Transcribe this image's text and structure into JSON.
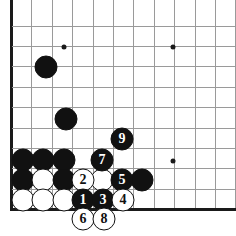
{
  "diagram": {
    "board": {
      "background_color": "#ffffff",
      "line_color": "#9a9a9a",
      "edge_color": "#1a1a1a",
      "grid_spacing": 20.4,
      "origin_x": 11.5,
      "origin_y": 26.0,
      "columns": 11,
      "rows": 10,
      "left_edge_is_board_border": true,
      "bottom_edge_is_board_border": true
    },
    "star_points": [
      {
        "name": "star-point-upper-left",
        "x": 64,
        "y": 47
      },
      {
        "name": "star-point-upper-right",
        "x": 173,
        "y": 47
      },
      {
        "name": "star-point-lower-right",
        "x": 173,
        "y": 161
      }
    ],
    "stones": [
      {
        "name": "black-stone-upper-left",
        "color": "black",
        "label": "",
        "x": 46,
        "y": 67
      },
      {
        "name": "black-stone-mid-left",
        "color": "black",
        "label": "",
        "x": 66,
        "y": 119
      },
      {
        "name": "black-stone-row-a1",
        "color": "black",
        "label": "",
        "x": 23,
        "y": 160
      },
      {
        "name": "black-stone-row-a2",
        "color": "black",
        "label": "",
        "x": 43,
        "y": 160
      },
      {
        "name": "black-stone-row-a3",
        "color": "black",
        "label": "",
        "x": 64,
        "y": 160
      },
      {
        "name": "black-stone-row-b1",
        "color": "black",
        "label": "",
        "x": 23,
        "y": 180
      },
      {
        "name": "white-stone-row-b2",
        "color": "white",
        "label": "",
        "x": 43,
        "y": 180
      },
      {
        "name": "black-stone-row-b3",
        "color": "black",
        "label": "",
        "x": 64,
        "y": 180
      },
      {
        "name": "white-stone-row-b5",
        "color": "white",
        "label": "",
        "x": 102,
        "y": 180
      },
      {
        "name": "black-stone-row-b7",
        "color": "black",
        "label": "",
        "x": 142,
        "y": 180
      },
      {
        "name": "white-stone-row-c1",
        "color": "white",
        "label": "",
        "x": 23,
        "y": 200
      },
      {
        "name": "white-stone-row-c2",
        "color": "white",
        "label": "",
        "x": 43,
        "y": 200
      },
      {
        "name": "white-stone-row-c3",
        "color": "white",
        "label": "",
        "x": 64,
        "y": 200
      },
      {
        "name": "move-stone-7",
        "color": "black",
        "label": "7",
        "x": 102,
        "y": 160
      },
      {
        "name": "move-stone-9",
        "color": "black",
        "label": "9",
        "x": 122,
        "y": 139
      },
      {
        "name": "move-stone-2",
        "color": "white",
        "label": "2",
        "x": 83,
        "y": 180
      },
      {
        "name": "move-stone-5",
        "color": "black",
        "label": "5",
        "x": 122,
        "y": 180
      },
      {
        "name": "move-stone-1",
        "color": "black",
        "label": "1",
        "x": 83,
        "y": 200
      },
      {
        "name": "move-stone-3",
        "color": "black",
        "label": "3",
        "x": 103,
        "y": 200
      },
      {
        "name": "move-stone-4",
        "color": "white",
        "label": "4",
        "x": 123,
        "y": 200
      },
      {
        "name": "move-stone-6",
        "color": "white",
        "label": "6",
        "x": 83,
        "y": 219
      },
      {
        "name": "move-stone-8",
        "color": "white",
        "label": "8",
        "x": 104,
        "y": 219
      }
    ]
  }
}
